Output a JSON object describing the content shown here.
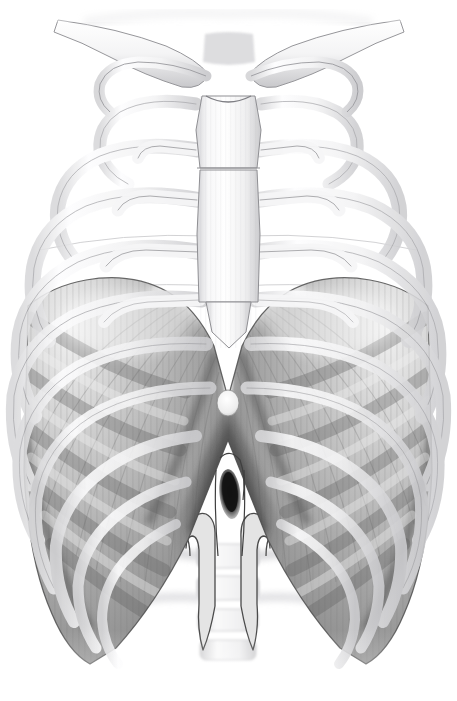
{
  "figure": {
    "title": "Anterior view of the thoracic cage with the diaphragm",
    "view": "anterior",
    "style": "grayscale pencil / airbrush medical illustration",
    "background_color": "#ffffff",
    "canvas": {
      "width": 457,
      "height": 701
    }
  },
  "palette": {
    "background": "#ffffff",
    "bone_light": "#fbfbfc",
    "bone_mid": "#ececed",
    "bone_shadow": "#c9c9cb",
    "bone_outline": "#8d8d91",
    "cartilage": "#f2f2f3",
    "diaphragm_light": "#c9c9c9",
    "diaphragm_mid": "#a8a8a8",
    "diaphragm_dark": "#808080",
    "diaphragm_deep": "#5e5e5e",
    "central_tendon": "#e3e3e3",
    "hiatus_dark": "#1c1c1c",
    "outline_dark": "#4a4a4a",
    "vertebra": "#e8e8e8"
  },
  "structures": [
    {
      "id": "clavicle-left",
      "label": "Clavicle (left)",
      "group": "skeleton"
    },
    {
      "id": "clavicle-right",
      "label": "Clavicle (right)",
      "group": "skeleton"
    },
    {
      "id": "manubrium",
      "label": "Manubrium of sternum",
      "group": "skeleton"
    },
    {
      "id": "sternal-body",
      "label": "Body of sternum",
      "group": "skeleton"
    },
    {
      "id": "xiphoid",
      "label": "Xiphoid process",
      "group": "skeleton"
    },
    {
      "id": "ribs-left",
      "label": "Ribs 1-10 (left)",
      "group": "skeleton"
    },
    {
      "id": "ribs-right",
      "label": "Ribs 1-10 (right)",
      "group": "skeleton"
    },
    {
      "id": "costal-cartilages",
      "label": "Costal cartilages",
      "group": "skeleton"
    },
    {
      "id": "diaphragm-dome-left",
      "label": "Left dome of diaphragm",
      "group": "muscle"
    },
    {
      "id": "diaphragm-dome-right",
      "label": "Right dome of diaphragm",
      "group": "muscle"
    },
    {
      "id": "central-tendon",
      "label": "Central tendon",
      "group": "muscle"
    },
    {
      "id": "crus-left",
      "label": "Left crus",
      "group": "muscle"
    },
    {
      "id": "crus-right",
      "label": "Right crus",
      "group": "muscle"
    },
    {
      "id": "aortic-hiatus",
      "label": "Aortic hiatus",
      "group": "opening"
    },
    {
      "id": "caval-opening",
      "label": "Caval opening",
      "group": "opening"
    },
    {
      "id": "lumbar-vertebrae",
      "label": "Lumbar vertebrae",
      "group": "skeleton"
    }
  ],
  "geometry": {
    "ribs_left": [
      {
        "n": 1,
        "cx": 172,
        "cy": 68,
        "rx": 78,
        "ry": 40,
        "rot": -14,
        "t": 9,
        "a0": 188,
        "a1": 352
      },
      {
        "n": 2,
        "cx": 168,
        "cy": 92,
        "rx": 100,
        "ry": 56,
        "rot": -12,
        "t": 11,
        "a0": 180,
        "a1": 356
      },
      {
        "n": 3,
        "cx": 164,
        "cy": 124,
        "rx": 118,
        "ry": 76,
        "rot": -10,
        "t": 12,
        "a0": 176,
        "a1": 358
      },
      {
        "n": 4,
        "cx": 160,
        "cy": 160,
        "rx": 134,
        "ry": 98,
        "rot": -8,
        "t": 13,
        "a0": 173,
        "a1": 360
      },
      {
        "n": 5,
        "cx": 158,
        "cy": 198,
        "rx": 146,
        "ry": 122,
        "rot": -6,
        "t": 13,
        "a0": 171,
        "a1": 360
      },
      {
        "n": 6,
        "cx": 156,
        "cy": 240,
        "rx": 152,
        "ry": 148,
        "rot": -5,
        "t": 13,
        "a0": 170,
        "a1": 358
      },
      {
        "n": 7,
        "cx": 156,
        "cy": 284,
        "rx": 154,
        "ry": 176,
        "rot": -4,
        "t": 13,
        "a0": 170,
        "a1": 352
      },
      {
        "n": 8,
        "cx": 158,
        "cy": 330,
        "rx": 152,
        "ry": 204,
        "rot": -3,
        "t": 12,
        "a0": 172,
        "a1": 344
      },
      {
        "n": 9,
        "cx": 162,
        "cy": 372,
        "rx": 146,
        "ry": 228,
        "rot": -2,
        "t": 12,
        "a0": 176,
        "a1": 336
      },
      {
        "n": 10,
        "cx": 166,
        "cy": 408,
        "rx": 138,
        "ry": 248,
        "rot": -1,
        "t": 11,
        "a0": 182,
        "a1": 326
      }
    ],
    "ribs_right": [
      {
        "n": 1,
        "cx": 285,
        "cy": 68,
        "rx": 78,
        "ry": 40,
        "rot": 14,
        "t": 9,
        "a0": 188,
        "a1": 352
      },
      {
        "n": 2,
        "cx": 289,
        "cy": 92,
        "rx": 100,
        "ry": 56,
        "rot": 12,
        "t": 11,
        "a0": 184,
        "a1": 360
      },
      {
        "n": 3,
        "cx": 293,
        "cy": 124,
        "rx": 118,
        "ry": 76,
        "rot": 10,
        "t": 12,
        "a0": 182,
        "a1": 364
      },
      {
        "n": 4,
        "cx": 297,
        "cy": 160,
        "rx": 134,
        "ry": 98,
        "rot": 8,
        "t": 13,
        "a0": 180,
        "a1": 367
      },
      {
        "n": 5,
        "cx": 299,
        "cy": 198,
        "rx": 146,
        "ry": 122,
        "rot": 6,
        "t": 13,
        "a0": 180,
        "a1": 369
      },
      {
        "n": 6,
        "cx": 301,
        "cy": 240,
        "rx": 152,
        "ry": 148,
        "rot": 5,
        "t": 13,
        "a0": 182,
        "a1": 370
      },
      {
        "n": 7,
        "cx": 301,
        "cy": 284,
        "rx": 154,
        "ry": 176,
        "rot": 4,
        "t": 13,
        "a0": 188,
        "a1": 370
      },
      {
        "n": 8,
        "cx": 299,
        "cy": 330,
        "rx": 152,
        "ry": 204,
        "rot": 3,
        "t": 12,
        "a0": 196,
        "a1": 368
      },
      {
        "n": 9,
        "cx": 295,
        "cy": 372,
        "rx": 146,
        "ry": 228,
        "rot": 2,
        "t": 12,
        "a0": 204,
        "a1": 364
      },
      {
        "n": 10,
        "cx": 291,
        "cy": 408,
        "rx": 138,
        "ry": 248,
        "rot": 1,
        "t": 11,
        "a0": 214,
        "a1": 358
      }
    ],
    "sternum": {
      "manubrium": "M 200 96 L 257 96 L 262 130 L 258 168 L 199 168 L 195 130 Z",
      "body": "M 200 170 L 257 170 L 260 232 L 258 300 L 200 300 L 197 232 Z",
      "xiphoid": "M 206 300 L 252 300 L 246 332 L 229 346 L 212 332 Z"
    },
    "clavicles": {
      "left": "M 62 22 Q 120 30 166 48 Q 196 60 205 72 Q 200 86 182 84 Q 146 74 110 56 Q 82 42 58 34 Z",
      "right": "M 396 22 Q 338 30 292 48 Q 262 60 253 72 Q 258 86 276 84 Q 312 74 348 56 Q 376 42 400 34 Z"
    },
    "diaphragm": {
      "outline": "M 28 306 Q 52 286 86 280 Q 132 272 168 292 Q 196 308 214 346 L 228 398 L 242 346 Q 260 308 288 292 Q 324 272 370 280 Q 404 286 428 306 L 432 470 Q 428 560 404 614 Q 388 652 366 664 L 340 648 Q 300 604 268 540 L 240 470 L 228 440 L 216 470 L 188 540 Q 156 604 116 648 L 90 664 Q 68 652 52 614 Q 28 560 24 470 Z",
      "central_tendon": "M 150 290 Q 196 296 222 344 Q 240 378 228 404 Q 216 378 234 344 Q 260 296 306 290 Q 278 268 228 266 Q 178 268 150 290 Z",
      "caval_opening": {
        "cx": 228,
        "cy": 403,
        "rx": 11,
        "ry": 13
      },
      "aortic_hiatus": {
        "cx": 230,
        "cy": 494,
        "rx": 10,
        "ry": 24,
        "rot": -6
      }
    },
    "crura": {
      "left": "M 188 528 Q 196 512 206 516 Q 214 521 213 536 L 213 608 Q 208 632 202 646 Q 198 628 199 606 L 199 548 Q 198 534 192 534 Q 187 535 186 546 Z",
      "right": "M 268 528 Q 260 512 250 516 Q 242 521 243 536 L 243 608 Q 248 632 254 646 Q 258 628 257 606 L 257 548 Q 258 534 264 534 Q 269 535 270 546 Z"
    },
    "vertebrae": [
      {
        "cx": 228,
        "cy": 556,
        "w": 62,
        "h": 24
      },
      {
        "cx": 228,
        "cy": 588,
        "w": 62,
        "h": 24
      },
      {
        "cx": 228,
        "cy": 620,
        "w": 60,
        "h": 22
      },
      {
        "cx": 228,
        "cy": 650,
        "w": 56,
        "h": 20
      }
    ]
  }
}
